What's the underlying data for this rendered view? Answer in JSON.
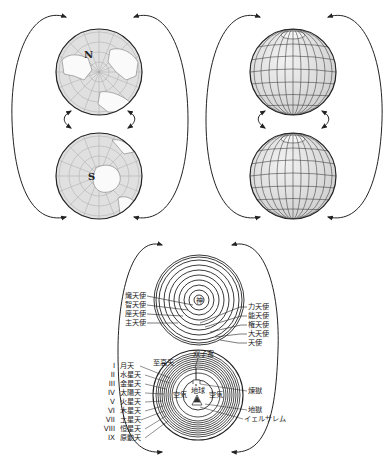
{
  "diagram": {
    "panels": [
      {
        "id": "earth-poles",
        "description": "Two hemispheres of Earth as a 3-sphere",
        "north_label": "N",
        "south_label": "S"
      },
      {
        "id": "globes",
        "description": "Two gridded spheres glued at their surfaces"
      },
      {
        "id": "dante-cosmos",
        "description": "Dante's Paradiso cosmology as a 3-sphere"
      }
    ],
    "angels": {
      "center_label": "神",
      "left_labels": [
        "熾天使",
        "智天使",
        "座天使",
        "主天使"
      ],
      "right_labels": [
        "力天使",
        "能天使",
        "権天使",
        "大天使",
        "天使"
      ]
    },
    "heavens": {
      "top_label": "双子宮",
      "empyrean_label": "至高天",
      "left_labels": [
        {
          "numeral": "I",
          "name": "月天"
        },
        {
          "numeral": "II",
          "name": "水星天"
        },
        {
          "numeral": "III",
          "name": "金星天"
        },
        {
          "numeral": "IV",
          "name": "太陽天"
        },
        {
          "numeral": "V",
          "name": "火星天"
        },
        {
          "numeral": "VI",
          "name": "木星天"
        },
        {
          "numeral": "VII",
          "name": "土星天"
        },
        {
          "numeral": "VIII",
          "name": "恒星天"
        },
        {
          "numeral": "IX",
          "name": "原動天"
        }
      ],
      "earth_label": "地球",
      "air_label_left": "空気",
      "air_label_right": "空気",
      "right_labels": [
        "煉獄",
        "地獄",
        "イェルサレム"
      ]
    },
    "colors": {
      "line": "#222222",
      "globe_fill": "#e2e2e2",
      "background": "#ffffff"
    }
  }
}
